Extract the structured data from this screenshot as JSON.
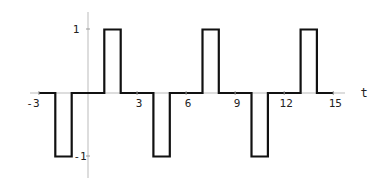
{
  "chart_data": {
    "type": "line",
    "title": "",
    "xlabel": "t",
    "ylabel": "",
    "xlim": [
      -3,
      15
    ],
    "ylim": [
      -1,
      1
    ],
    "grid": false,
    "legend": null,
    "x_ticks": [
      -3,
      3,
      6,
      9,
      12,
      15
    ],
    "x_tick_labels": [
      "-3",
      "3",
      "6",
      "9",
      "12",
      "15"
    ],
    "y_ticks": [
      1,
      -1
    ],
    "y_tick_labels": [
      "1",
      "-1"
    ],
    "series": [
      {
        "name": "square pulse train",
        "step": true,
        "x": [
          -3,
          -2,
          -2,
          -1,
          -1,
          1,
          1,
          2,
          2,
          4,
          4,
          5,
          5,
          7,
          7,
          8,
          8,
          10,
          10,
          11,
          11,
          13,
          13,
          14,
          14,
          15
        ],
        "y": [
          0,
          0,
          -1,
          -1,
          0,
          0,
          1,
          1,
          0,
          0,
          -1,
          -1,
          0,
          0,
          1,
          1,
          0,
          0,
          -1,
          -1,
          0,
          0,
          1,
          1,
          0,
          0
        ]
      }
    ]
  }
}
